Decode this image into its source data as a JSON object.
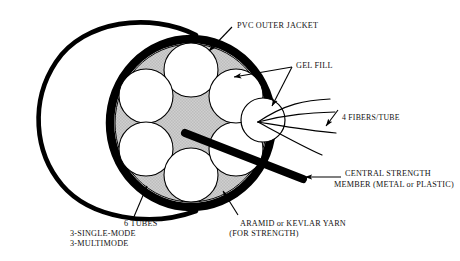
{
  "diagram": {
    "type": "technical-cutaway-illustration",
    "colors": {
      "outline": "#000000",
      "gel_fill": "#c9c9c9",
      "tube_fill": "#ffffff",
      "jacket": "#000000",
      "text": "#111111",
      "background": "#ffffff"
    },
    "labels": {
      "pvc_outer_jacket": "PVC OUTER JACKET",
      "gel_fill": "GEL FILL",
      "fibers_per_tube": "4 FIBERS/TUBE",
      "central_strength_line1": "CENTRAL STRENGTH",
      "central_strength_line2": "MEMBER (METAL or PLASTIC)",
      "aramid_line1": "ARAMID or KEVLAR YARN",
      "aramid_line2": "(FOR STRENGTH)",
      "tubes_line1": "6 TUBES",
      "tubes_line2": "3-SINGLE-MODE",
      "tubes_line3": "3-MULTIMODE"
    },
    "components": {
      "tube_count": 6,
      "single_mode_tubes": 3,
      "multimode_tubes": 3,
      "fibers_per_tube": 4
    },
    "icons": {
      "arrow": "arrow-head",
      "leader": "leader-line"
    }
  }
}
